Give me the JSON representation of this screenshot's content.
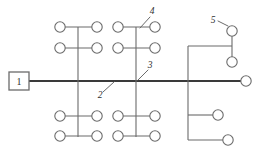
{
  "diagram": {
    "type": "line-schematic",
    "canvas": {
      "width": 262,
      "height": 154
    },
    "colors": {
      "background": "#ffffff",
      "trunk": "#3a3a3a",
      "branch": "#6b6b6b",
      "node_fill": "#ffffff",
      "text": "#2f2f2f"
    },
    "source": {
      "label": "1",
      "shape": "square",
      "x": 9,
      "y": 72,
      "width": 20,
      "height": 18
    },
    "trunk": {
      "label": "main-bus",
      "x1": 29,
      "y1": 81,
      "x2": 241,
      "y2": 81
    },
    "callouts": [
      {
        "label": "1",
        "kind": "source-box",
        "text_x": 19,
        "text_y": 85,
        "leader": null
      },
      {
        "label": "2",
        "kind": "trunk-segment",
        "text_x": 100,
        "text_y": 98,
        "leader": {
          "x1": 103,
          "y1": 92,
          "x2": 114,
          "y2": 82
        }
      },
      {
        "label": "3",
        "kind": "branch-riser",
        "text_x": 150,
        "text_y": 68,
        "leader": {
          "x1": 148,
          "y1": 70,
          "x2": 138,
          "y2": 80
        }
      },
      {
        "label": "4",
        "kind": "lateral-tap",
        "text_x": 152,
        "text_y": 14,
        "leader": {
          "x1": 150,
          "y1": 17,
          "x2": 140,
          "y2": 28
        }
      },
      {
        "label": "5",
        "kind": "end-node",
        "text_x": 213,
        "text_y": 23,
        "leader": {
          "x1": 218,
          "y1": 21,
          "x2": 228,
          "y2": 26
        }
      }
    ],
    "risers": [
      {
        "name": "riser-left",
        "x": 78,
        "y_top": 27,
        "y_bottom": 137
      },
      {
        "name": "riser-middle",
        "x": 136,
        "y_top": 27,
        "y_bottom": 137
      },
      {
        "name": "riser-right",
        "x": 188,
        "y_top": 46,
        "y_bottom": 140
      }
    ],
    "laterals": [
      {
        "name": "lateral-upper-left-1",
        "y": 27,
        "x1": 60,
        "x2": 97
      },
      {
        "name": "lateral-upper-left-2",
        "y": 48,
        "x1": 60,
        "x2": 97
      },
      {
        "name": "lateral-upper-mid-1",
        "y": 27,
        "x1": 118,
        "x2": 155
      },
      {
        "name": "lateral-upper-mid-2",
        "y": 48,
        "x1": 118,
        "x2": 155
      },
      {
        "name": "lateral-lower-left-1",
        "y": 116,
        "x1": 60,
        "x2": 97
      },
      {
        "name": "lateral-lower-left-2",
        "y": 136,
        "x1": 60,
        "x2": 97
      },
      {
        "name": "lateral-lower-mid-1",
        "y": 116,
        "x1": 118,
        "x2": 155
      },
      {
        "name": "lateral-lower-mid-2",
        "y": 136,
        "x1": 118,
        "x2": 155
      },
      {
        "name": "lateral-right-upper",
        "y": 46,
        "x1": 188,
        "x2": 232
      },
      {
        "name": "lateral-right-mid",
        "y": 115,
        "x1": 188,
        "x2": 218
      },
      {
        "name": "lateral-right-lower",
        "y": 140,
        "x1": 188,
        "x2": 228
      }
    ],
    "nodes": [
      {
        "name": "node-upper-left-a",
        "cx": 60,
        "cy": 27,
        "r": 5.2
      },
      {
        "name": "node-upper-left-b",
        "cx": 97,
        "cy": 27,
        "r": 5.2
      },
      {
        "name": "node-upper-left-c",
        "cx": 60,
        "cy": 48,
        "r": 5.2
      },
      {
        "name": "node-upper-left-d",
        "cx": 97,
        "cy": 48,
        "r": 5.2
      },
      {
        "name": "node-upper-mid-a",
        "cx": 118,
        "cy": 27,
        "r": 5.2
      },
      {
        "name": "node-upper-mid-b",
        "cx": 155,
        "cy": 27,
        "r": 5.2
      },
      {
        "name": "node-upper-mid-c",
        "cx": 118,
        "cy": 48,
        "r": 5.2
      },
      {
        "name": "node-upper-mid-d",
        "cx": 155,
        "cy": 48,
        "r": 5.2
      },
      {
        "name": "node-lower-left-a",
        "cx": 60,
        "cy": 116,
        "r": 5.2
      },
      {
        "name": "node-lower-left-b",
        "cx": 97,
        "cy": 116,
        "r": 5.2
      },
      {
        "name": "node-lower-left-c",
        "cx": 60,
        "cy": 136,
        "r": 5.2
      },
      {
        "name": "node-lower-left-d",
        "cx": 97,
        "cy": 136,
        "r": 5.2
      },
      {
        "name": "node-lower-mid-a",
        "cx": 118,
        "cy": 116,
        "r": 5.2
      },
      {
        "name": "node-lower-mid-b",
        "cx": 155,
        "cy": 116,
        "r": 5.2
      },
      {
        "name": "node-lower-mid-c",
        "cx": 118,
        "cy": 136,
        "r": 5.2
      },
      {
        "name": "node-lower-mid-d",
        "cx": 155,
        "cy": 136,
        "r": 5.2
      },
      {
        "name": "node-right-top",
        "cx": 232,
        "cy": 31,
        "r": 5.2
      },
      {
        "name": "node-right-upper",
        "cx": 232,
        "cy": 62,
        "r": 5.2
      },
      {
        "name": "node-right-mid",
        "cx": 218,
        "cy": 115,
        "r": 5.2
      },
      {
        "name": "node-right-lower",
        "cx": 228,
        "cy": 140,
        "r": 5.2
      },
      {
        "name": "node-trunk-end",
        "cx": 246,
        "cy": 81,
        "r": 5.2
      }
    ],
    "right_stub": {
      "name": "right-top-stub",
      "x": 232,
      "y_top": 31,
      "y_bottom": 62
    }
  }
}
